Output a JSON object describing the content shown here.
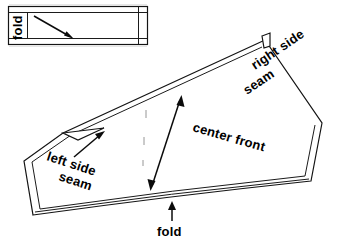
{
  "figure": {
    "background_color": "#ffffff",
    "line_color": "#141414",
    "text_color": "#000000"
  },
  "waistband_piece": {
    "name": "waistband-rectangle",
    "fold_label": "fold",
    "fold_label_rotation": -90,
    "arrow": {
      "name": "grainline-arrow",
      "direction": "diagonal-down-right",
      "from": [
        34,
        16
      ],
      "to": [
        73,
        38
      ]
    },
    "outline": {
      "x": 8,
      "y": 6,
      "width": 140,
      "height": 39,
      "seam_inset_top": 6,
      "seam_inset_bottom": 6,
      "seam_inset_right": 9
    }
  },
  "skirt_piece": {
    "name": "skirt-front-panel",
    "labels": [
      {
        "id": "right-side-seam",
        "text_line_1": "right side",
        "text_line_2": "seam",
        "rotation": -32,
        "x": 252,
        "y": 62
      },
      {
        "id": "center-front",
        "text_line_1": "center front",
        "rotation": 15,
        "x": 188,
        "y": 118
      },
      {
        "id": "left-side-seam",
        "text_line_1": "left side",
        "text_line_2": "seam",
        "rotation": 18,
        "x": 44,
        "y": 148
      },
      {
        "id": "fold-bottom",
        "text_line_1": "fold",
        "rotation": 0,
        "x": 160,
        "y": 232
      }
    ],
    "arrows": [
      {
        "id": "center-front-grainline-arrow",
        "type": "double-headed",
        "from": [
          150,
          190
        ],
        "to": [
          182,
          96
        ]
      },
      {
        "id": "left-side-seam-pointer-arrow",
        "type": "single-headed",
        "from": [
          72,
          158
        ],
        "to": [
          104,
          132
        ]
      },
      {
        "id": "fold-pointer-arrow",
        "type": "single-headed",
        "from": [
          172,
          222
        ],
        "to": [
          172,
          203
        ]
      }
    ],
    "vertices": {
      "apex_top": [
        265,
        40
      ],
      "upper_left": [
        63,
        133
      ],
      "left_lower": [
        24,
        161
      ],
      "bottom_left": [
        33,
        215
      ],
      "bottom_right": [
        311,
        181
      ],
      "right_mid": [
        322,
        123
      ]
    }
  }
}
